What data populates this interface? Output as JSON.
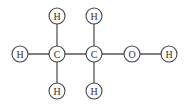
{
  "diagram": {
    "atoms": [
      {
        "id": "H1",
        "label": "H",
        "x": 20,
        "y": 54
      },
      {
        "id": "C1",
        "label": "C",
        "x": 57,
        "y": 54
      },
      {
        "id": "C2",
        "label": "C",
        "x": 94,
        "y": 54
      },
      {
        "id": "O1",
        "label": "O",
        "x": 132,
        "y": 54
      },
      {
        "id": "H2",
        "label": "H",
        "x": 169,
        "y": 54
      },
      {
        "id": "H3",
        "label": "H",
        "x": 57,
        "y": 16
      },
      {
        "id": "H4",
        "label": "H",
        "x": 94,
        "y": 16
      },
      {
        "id": "H5",
        "label": "H",
        "x": 57,
        "y": 91
      },
      {
        "id": "H6",
        "label": "H",
        "x": 94,
        "y": 91
      }
    ],
    "bonds": [
      [
        "H1",
        "C1"
      ],
      [
        "C1",
        "C2"
      ],
      [
        "C2",
        "O1"
      ],
      [
        "O1",
        "H2"
      ],
      [
        "C1",
        "H3"
      ],
      [
        "C1",
        "H5"
      ],
      [
        "C2",
        "H4"
      ],
      [
        "C2",
        "H6"
      ]
    ],
    "atom_radius": 8
  }
}
